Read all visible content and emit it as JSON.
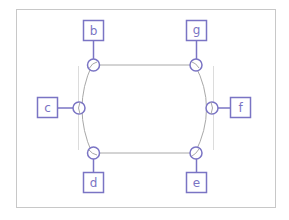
{
  "diagram": {
    "type": "ring-network",
    "colors": {
      "frame": "#c8c8c8",
      "ring": "#a8a8a8",
      "guide": "#dcdcdc",
      "node": "#7a74c4"
    },
    "nodes": [
      {
        "id": "b",
        "label": "b",
        "position": "top-left"
      },
      {
        "id": "g",
        "label": "g",
        "position": "top-right"
      },
      {
        "id": "c",
        "label": "c",
        "position": "left"
      },
      {
        "id": "f",
        "label": "f",
        "position": "right"
      },
      {
        "id": "d",
        "label": "d",
        "position": "bottom-left"
      },
      {
        "id": "e",
        "label": "e",
        "position": "bottom-right"
      }
    ]
  }
}
